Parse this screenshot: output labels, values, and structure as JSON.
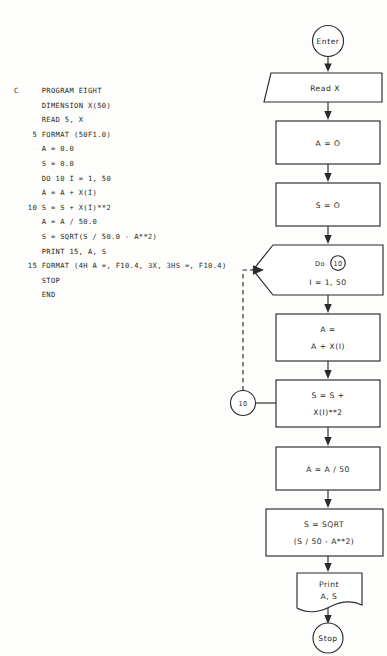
{
  "document": {
    "title": "PROGRAM EIGHT flowchart and FORTRAN listing",
    "ink_color": "#2b2b2b",
    "paper_color": "#fdfdfb"
  },
  "code_listing": {
    "name": "fortran-program-eight",
    "lines": [
      "C     PROGRAM EIGHT",
      "      DIMENSION X(50)",
      "      READ 5, X",
      "    5 FORMAT (50F1.0)",
      "      A = 0.0",
      "      S = 0.0",
      "      DO 10 I = 1, 50",
      "      A = A + X(I)",
      "   10 S = S + X(I)**2",
      "      A = A / 50.0",
      "      S = SQRT(S / 50.0 - A**2)",
      "      PRINT 15, A, S",
      "   15 FORMAT (4H A =, F10.4, 3X, 3HS =, F10.4)",
      "      STOP",
      "      END"
    ]
  },
  "flowchart": {
    "nodes": {
      "enter": {
        "label": "Enter",
        "shape": "terminator-circle"
      },
      "read": {
        "label": "Read X",
        "shape": "input-parallelogram"
      },
      "init_a": {
        "label": "A = O",
        "shape": "process-rect"
      },
      "init_s": {
        "label": "S = O",
        "shape": "process-rect"
      },
      "do_loop": {
        "line1_prefix": "Do",
        "line1_tag": "10",
        "line2": "I = 1, 50",
        "shape": "loop-hexagon"
      },
      "accum_a": {
        "line1": "A =",
        "line2": "A + X(I)",
        "shape": "process-rect"
      },
      "accum_s": {
        "line1": "S = S +",
        "line2": "X(I)**2",
        "shape": "process-rect"
      },
      "connector_10": {
        "label": "10",
        "shape": "connector-circle"
      },
      "mean_a": {
        "label": "A = A / 50",
        "shape": "process-rect"
      },
      "stddev_s": {
        "line1": "S = SQRT",
        "line2": "(S / 50 - A**2)",
        "shape": "process-rect"
      },
      "print": {
        "line1": "Print",
        "line2": "A, S",
        "shape": "document"
      },
      "stop": {
        "label": "Stop",
        "shape": "terminator-circle"
      }
    },
    "edges": [
      {
        "from": "enter",
        "to": "read",
        "style": "solid-arrow"
      },
      {
        "from": "read",
        "to": "init_a",
        "style": "solid-arrow"
      },
      {
        "from": "init_a",
        "to": "init_s",
        "style": "solid-arrow"
      },
      {
        "from": "init_s",
        "to": "do_loop",
        "style": "solid-arrow"
      },
      {
        "from": "do_loop",
        "to": "accum_a",
        "style": "solid-arrow"
      },
      {
        "from": "accum_a",
        "to": "accum_s",
        "style": "solid-arrow"
      },
      {
        "from": "connector_10",
        "to": "accum_s",
        "style": "solid-line"
      },
      {
        "from": "connector_10",
        "to": "do_loop",
        "style": "dashed-arrow"
      },
      {
        "from": "accum_s",
        "to": "mean_a",
        "style": "solid-arrow"
      },
      {
        "from": "mean_a",
        "to": "stddev_s",
        "style": "solid-arrow"
      },
      {
        "from": "stddev_s",
        "to": "print",
        "style": "solid-arrow"
      },
      {
        "from": "print",
        "to": "stop",
        "style": "solid-arrow"
      }
    ]
  }
}
